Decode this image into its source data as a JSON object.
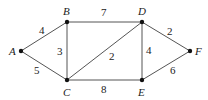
{
  "graph": {
    "nodes": [
      {
        "id": "A",
        "x": 21,
        "y": 51,
        "lx": 9,
        "ly": 55
      },
      {
        "id": "B",
        "x": 67,
        "y": 22,
        "lx": 63,
        "ly": 15
      },
      {
        "id": "C",
        "x": 67,
        "y": 80,
        "lx": 63,
        "ly": 96
      },
      {
        "id": "D",
        "x": 142,
        "y": 22,
        "lx": 138,
        "ly": 15
      },
      {
        "id": "E",
        "x": 142,
        "y": 80,
        "lx": 138,
        "ly": 96
      },
      {
        "id": "F",
        "x": 190,
        "y": 51,
        "lx": 195,
        "ly": 55
      }
    ],
    "edges": [
      {
        "from": "A",
        "to": "B",
        "weight": "4",
        "lx": 39,
        "ly": 34
      },
      {
        "from": "A",
        "to": "C",
        "weight": "5",
        "lx": 34,
        "ly": 74
      },
      {
        "from": "B",
        "to": "C",
        "weight": "3",
        "lx": 57,
        "ly": 55
      },
      {
        "from": "B",
        "to": "D",
        "weight": "7",
        "lx": 101,
        "ly": 16
      },
      {
        "from": "C",
        "to": "D",
        "weight": "2",
        "lx": 109,
        "ly": 60
      },
      {
        "from": "C",
        "to": "E",
        "weight": "8",
        "lx": 101,
        "ly": 93
      },
      {
        "from": "D",
        "to": "E",
        "weight": "4",
        "lx": 146,
        "ly": 54
      },
      {
        "from": "D",
        "to": "F",
        "weight": "2",
        "lx": 167,
        "ly": 35
      },
      {
        "from": "E",
        "to": "F",
        "weight": "6",
        "lx": 170,
        "ly": 74
      }
    ]
  }
}
